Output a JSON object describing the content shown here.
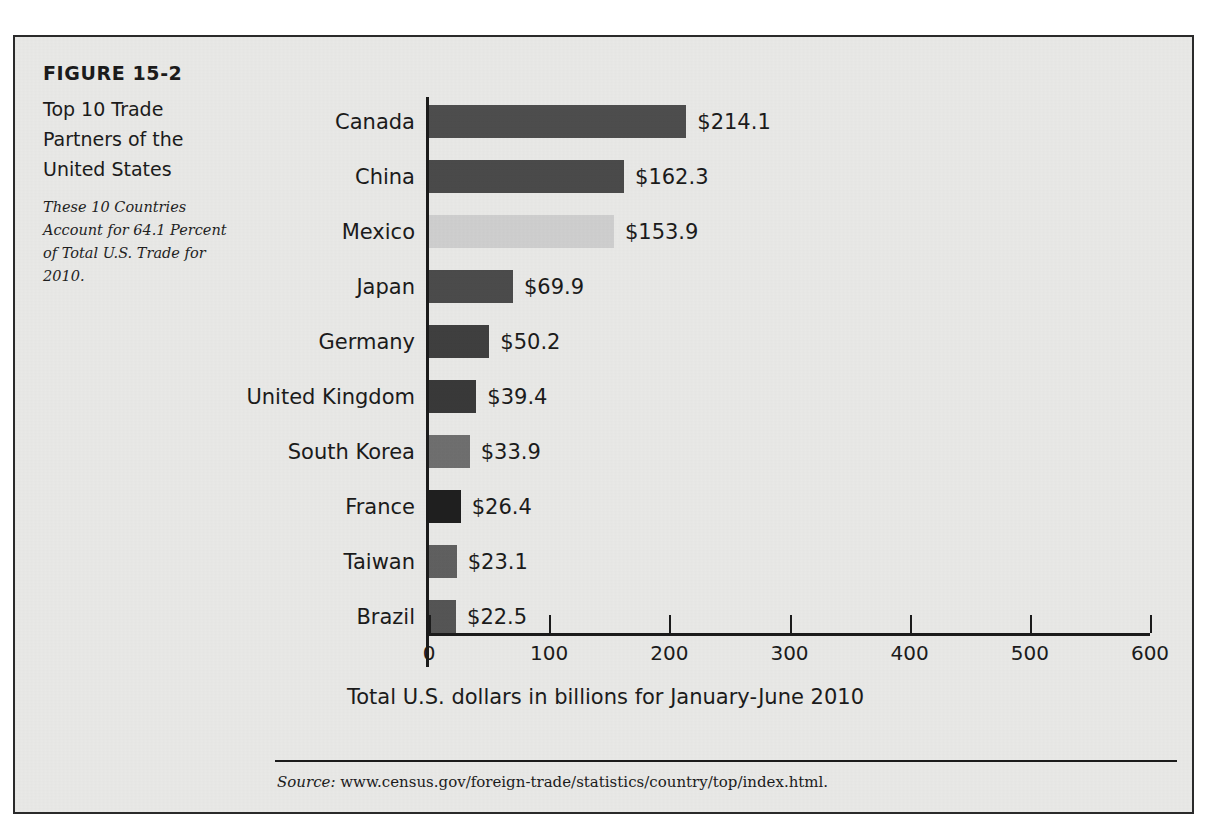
{
  "figure": {
    "number": "FIGURE 15-2",
    "title": "Top 10 Trade Partners of the United States",
    "subtitle": "These 10 Countries Account for 64.1 Percent of Total U.S. Trade for 2010.",
    "source_label": "Source:",
    "source_url": "www.census.gov/foreign-trade/statistics/country/top/index.html."
  },
  "chart_data": {
    "type": "bar",
    "orientation": "horizontal",
    "title": "Top 10 Trade Partners of the United States",
    "xlabel": "Total U.S. dollars in billions for January-June 2010",
    "ylabel": "",
    "xlim": [
      0,
      600
    ],
    "xticks": [
      0,
      100,
      200,
      300,
      400,
      500,
      600
    ],
    "xtick_labels": [
      "0",
      "100",
      "200",
      "300",
      "400",
      "500",
      "600"
    ],
    "grid": false,
    "legend": false,
    "categories": [
      "Canada",
      "China",
      "Mexico",
      "Japan",
      "Germany",
      "United Kingdom",
      "South Korea",
      "France",
      "Taiwan",
      "Brazil"
    ],
    "values": [
      214.1,
      162.3,
      153.9,
      69.9,
      50.2,
      39.4,
      33.9,
      26.4,
      23.1,
      22.5
    ],
    "value_labels": [
      "$214.1",
      "$162.3",
      "$153.9",
      "$69.9",
      "$50.2",
      "$39.4",
      "$33.9",
      "$26.4",
      "$23.1",
      "$22.5"
    ],
    "bar_colors": [
      "#4d4d4d",
      "#4a4a4a",
      "#cfcfcf",
      "#4b4b4b",
      "#3f3f3f",
      "#393939",
      "#6f6f6f",
      "#1f1f1f",
      "#606060",
      "#555555"
    ]
  }
}
